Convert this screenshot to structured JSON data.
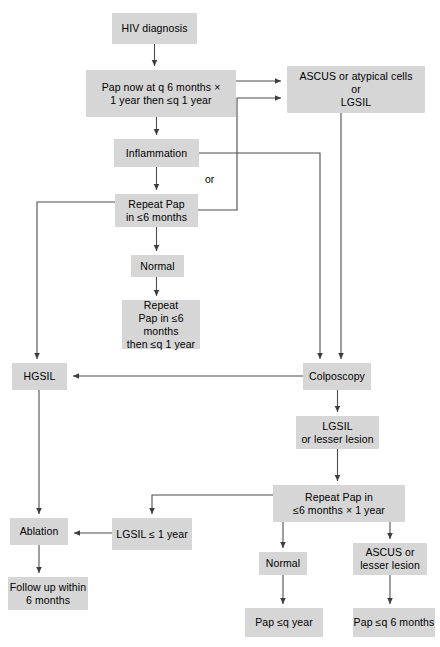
{
  "diagram": {
    "box_fill": "#d6d6d6",
    "line_color": "#4d4d4d",
    "text_color": "#000000",
    "nodes": [
      {
        "id": "hiv_diagnosis",
        "label": "HIV diagnosis",
        "x": 112,
        "y": 13,
        "w": 85,
        "h": 31
      },
      {
        "id": "pap_now",
        "label": "Pap now at q 6 months ×\n1 year then ≤q 1 year",
        "x": 86,
        "y": 70,
        "w": 150,
        "h": 47
      },
      {
        "id": "ascus_atypical",
        "label": "ASCUS or atypical cells\nor\nLGSIL",
        "x": 287,
        "y": 66,
        "w": 138,
        "h": 47
      },
      {
        "id": "inflammation",
        "label": "Inflammation",
        "x": 114,
        "y": 139,
        "w": 85,
        "h": 28
      },
      {
        "id": "repeat_pap_6mo",
        "label": "Repeat Pap\nin ≤6 months",
        "x": 115,
        "y": 194,
        "w": 83,
        "h": 33
      },
      {
        "id": "normal_mid",
        "label": "Normal",
        "x": 131,
        "y": 255,
        "w": 53,
        "h": 22
      },
      {
        "id": "repeat_pap_then_q1",
        "label": "Repeat\nPap in ≤6 months\nthen ≤q 1 year",
        "x": 122,
        "y": 300,
        "w": 78,
        "h": 49
      },
      {
        "id": "hgsil",
        "label": "HGSIL",
        "x": 12,
        "y": 363,
        "w": 55,
        "h": 27
      },
      {
        "id": "colposcopy",
        "label": "Colposcopy",
        "x": 303,
        "y": 363,
        "w": 68,
        "h": 27
      },
      {
        "id": "lgsil_lesser",
        "label": "LGSIL\nor lesser lesion",
        "x": 296,
        "y": 416,
        "w": 83,
        "h": 33
      },
      {
        "id": "repeat_pap_1yr",
        "label": "Repeat Pap in\n≤6 months × 1 year",
        "x": 273,
        "y": 485,
        "w": 132,
        "h": 37
      },
      {
        "id": "lgsil_1yr",
        "label": "LGSIL ≤ 1 year",
        "x": 112,
        "y": 518,
        "w": 80,
        "h": 32
      },
      {
        "id": "ablation",
        "label": "Ablation",
        "x": 10,
        "y": 518,
        "w": 58,
        "h": 27
      },
      {
        "id": "follow_up",
        "label": "Follow up within\n6 months",
        "x": 8,
        "y": 577,
        "w": 80,
        "h": 33
      },
      {
        "id": "normal_bottom",
        "label": "Normal",
        "x": 259,
        "y": 552,
        "w": 48,
        "h": 23
      },
      {
        "id": "ascus_lesser",
        "label": "ASCUS or\nlesser lesion",
        "x": 353,
        "y": 543,
        "w": 74,
        "h": 32
      },
      {
        "id": "pap_q_year",
        "label": "Pap ≤q year",
        "x": 245,
        "y": 608,
        "w": 78,
        "h": 29
      },
      {
        "id": "pap_q_6months",
        "label": "Pap ≤q 6 months",
        "x": 353,
        "y": 608,
        "w": 82,
        "h": 29
      }
    ],
    "labels": [
      {
        "id": "or_label",
        "text": "or",
        "x": 205,
        "y": 173
      }
    ],
    "edges": [
      {
        "id": "hiv-to-pap",
        "from": "hiv_diagnosis",
        "to": "pap_now"
      },
      {
        "id": "pap-to-ascus",
        "from": "pap_now",
        "to": "ascus_atypical"
      },
      {
        "id": "pap-to-inflammation",
        "from": "pap_now",
        "to": "inflammation"
      },
      {
        "id": "inflammation-to-repeat",
        "from": "inflammation",
        "to": "repeat_pap_6mo"
      },
      {
        "id": "inflammation-to-colpo",
        "from": "inflammation",
        "to": "colposcopy"
      },
      {
        "id": "repeat-to-ascus",
        "from": "repeat_pap_6mo",
        "to": "ascus_atypical"
      },
      {
        "id": "repeat-to-hgsil",
        "from": "repeat_pap_6mo",
        "to": "hgsil"
      },
      {
        "id": "repeat-to-normal",
        "from": "repeat_pap_6mo",
        "to": "normal_mid"
      },
      {
        "id": "normal-to-repeatq1",
        "from": "normal_mid",
        "to": "repeat_pap_then_q1"
      },
      {
        "id": "ascus-to-colpo",
        "from": "ascus_atypical",
        "to": "colposcopy"
      },
      {
        "id": "colpo-to-hgsil",
        "from": "colposcopy",
        "to": "hgsil"
      },
      {
        "id": "colpo-to-lgsil",
        "from": "colposcopy",
        "to": "lgsil_lesser"
      },
      {
        "id": "lgsil-to-repeat1yr",
        "from": "lgsil_lesser",
        "to": "repeat_pap_1yr"
      },
      {
        "id": "repeat1yr-to-lgsil1yr",
        "from": "repeat_pap_1yr",
        "to": "lgsil_1yr"
      },
      {
        "id": "lgsil1yr-to-ablation",
        "from": "lgsil_1yr",
        "to": "ablation"
      },
      {
        "id": "hgsil-to-ablation",
        "from": "hgsil",
        "to": "ablation"
      },
      {
        "id": "ablation-to-followup",
        "from": "ablation",
        "to": "follow_up"
      },
      {
        "id": "repeat1yr-to-normal",
        "from": "repeat_pap_1yr",
        "to": "normal_bottom"
      },
      {
        "id": "repeat1yr-to-ascuslesser",
        "from": "repeat_pap_1yr",
        "to": "ascus_lesser"
      },
      {
        "id": "normalb-to-papqyear",
        "from": "normal_bottom",
        "to": "pap_q_year"
      },
      {
        "id": "ascuslesser-to-papq6",
        "from": "ascus_lesser",
        "to": "pap_q_6months"
      }
    ]
  }
}
